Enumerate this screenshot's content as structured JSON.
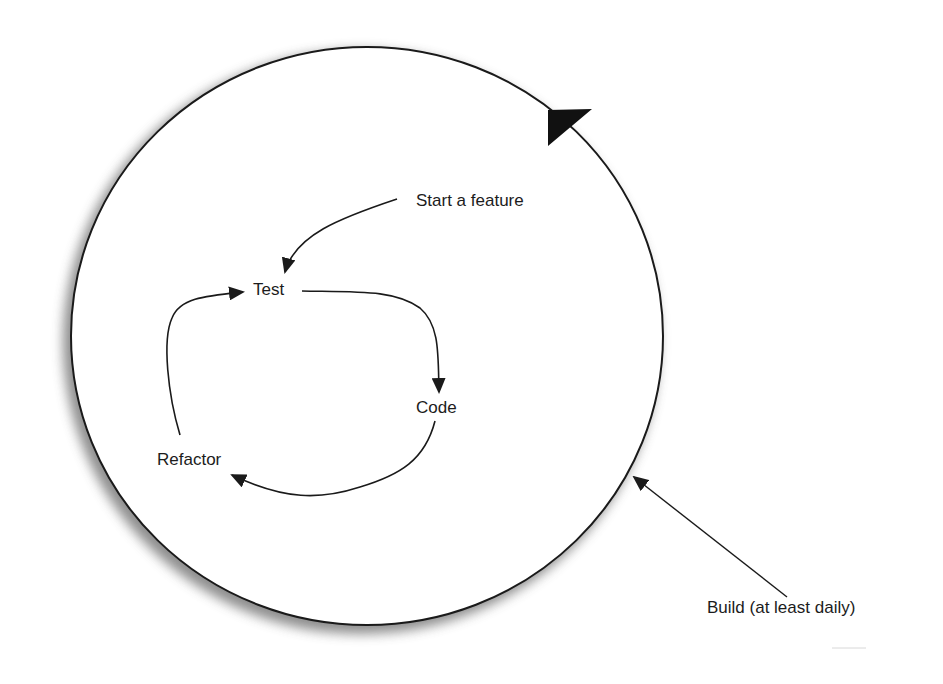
{
  "diagram": {
    "type": "process-cycle",
    "nodes": {
      "start": "Start a feature",
      "test": "Test",
      "code": "Code",
      "refactor": "Refactor",
      "build": "Build (at least daily)"
    },
    "edges": [
      {
        "from": "Start a feature",
        "to": "Test"
      },
      {
        "from": "Test",
        "to": "Code"
      },
      {
        "from": "Code",
        "to": "Refactor"
      },
      {
        "from": "Refactor",
        "to": "Test"
      }
    ],
    "outer_cycle": {
      "label": "Build (at least daily)",
      "direction": "clockwise"
    },
    "colors": {
      "line": "#1a1a1a",
      "shadow": "#8a8a8a",
      "background": "#ffffff"
    }
  }
}
